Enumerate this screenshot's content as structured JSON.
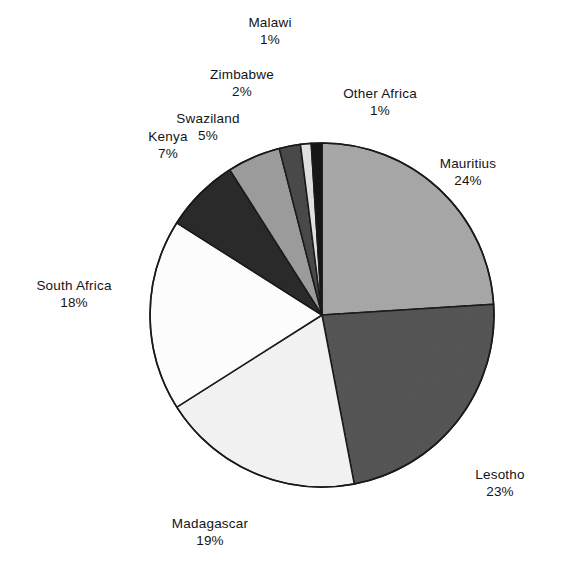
{
  "chart_data": {
    "type": "pie",
    "title": "",
    "subtitle": "",
    "xlabel": "",
    "ylabel": "",
    "legend_position": "none",
    "grid": false,
    "units": "percent",
    "start_angle_deg": 0,
    "direction": "clockwise",
    "center": {
      "x": 322,
      "y": 315
    },
    "radius": 172,
    "categories": [
      "Mauritius",
      "Lesotho",
      "Madagascar",
      "South Africa",
      "Kenya",
      "Swaziland",
      "Zimbabwe",
      "Malawi",
      "Other Africa"
    ],
    "values": [
      24,
      23,
      19,
      18,
      7,
      5,
      2,
      1,
      1
    ],
    "slices": [
      {
        "label": "Mauritius",
        "value": 24,
        "value_label": "24%",
        "fill": "#a8a8a8",
        "stroke": "#1a1a1a",
        "start_deg": 0,
        "end_deg": 86.4,
        "label_pos": "right-top"
      },
      {
        "label": "Lesotho",
        "value": 23,
        "value_label": "23%",
        "fill": "#555555",
        "stroke": "#1a1a1a",
        "start_deg": 86.4,
        "end_deg": 169.2,
        "label_pos": "right-bottom"
      },
      {
        "label": "Madagascar",
        "value": 19,
        "value_label": "19%",
        "fill": "#f4f4f4",
        "stroke": "#1a1a1a",
        "start_deg": 169.2,
        "end_deg": 237.6,
        "label_pos": "bottom"
      },
      {
        "label": "South Africa",
        "value": 18,
        "value_label": "18%",
        "fill": "#ffffff",
        "stroke": "#1a1a1a",
        "start_deg": 237.6,
        "end_deg": 302.4,
        "label_pos": "left"
      },
      {
        "label": "Kenya",
        "value": 7,
        "value_label": "7%",
        "fill": "#2b2b2b",
        "stroke": "#1a1a1a",
        "start_deg": 302.4,
        "end_deg": 327.6,
        "label_pos": "left-top"
      },
      {
        "label": "Swaziland",
        "value": 5,
        "value_label": "5%",
        "fill": "#9d9d9d",
        "stroke": "#1a1a1a",
        "start_deg": 327.6,
        "end_deg": 345.6,
        "label_pos": "top-left"
      },
      {
        "label": "Zimbabwe",
        "value": 2,
        "value_label": "2%",
        "fill": "#4a4a4a",
        "stroke": "#1a1a1a",
        "start_deg": 345.6,
        "end_deg": 352.8,
        "label_pos": "top-left"
      },
      {
        "label": "Malawi",
        "value": 1,
        "value_label": "1%",
        "fill": "#e2e2e2",
        "stroke": "#1a1a1a",
        "start_deg": 352.8,
        "end_deg": 356.4,
        "label_pos": "top"
      },
      {
        "label": "Other Africa",
        "value": 1,
        "value_label": "1%",
        "fill": "#151515",
        "stroke": "#1a1a1a",
        "start_deg": 356.4,
        "end_deg": 360,
        "label_pos": "top-right"
      }
    ]
  },
  "labels": {
    "malawi": {
      "name": "Malawi",
      "pct": "1%"
    },
    "zimbabwe": {
      "name": "Zimbabwe",
      "pct": "2%"
    },
    "other_africa": {
      "name": "Other  Africa",
      "pct": "1%"
    },
    "swaziland": {
      "name": "Swaziland",
      "pct": "5%"
    },
    "kenya": {
      "name": "Kenya",
      "pct": "7%"
    },
    "south_africa": {
      "name": "South  Africa",
      "pct": "18%"
    },
    "mauritius": {
      "name": "Mauritius",
      "pct": "24%"
    },
    "lesotho": {
      "name": "Lesotho",
      "pct": "23%"
    },
    "madagascar": {
      "name": "Madagascar",
      "pct": "19%"
    }
  },
  "colors": {
    "background": "#ffffff",
    "outline": "#1a1a1a",
    "text": "#141414"
  }
}
